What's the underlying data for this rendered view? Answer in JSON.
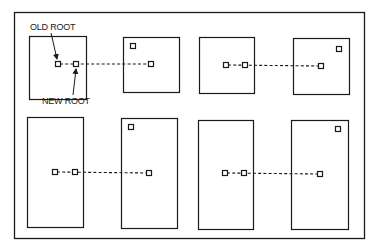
{
  "diagram": {
    "labels": {
      "old_root": "OLD ROOT",
      "new_root": "NEW ROOT"
    },
    "colors": {
      "ink": "#1a1a1a",
      "background": "#ffffff"
    },
    "frame": {
      "x": 14,
      "y": 12,
      "w": 351,
      "h": 227
    },
    "panels": [
      {
        "id": "top-1",
        "x": 29,
        "y": 36,
        "w": 58,
        "h": 63,
        "nodes": [
          [
            58,
            63
          ],
          [
            76,
            64
          ]
        ],
        "line_to": [
          151,
          64
        ]
      },
      {
        "id": "top-2",
        "x": 123,
        "y": 37,
        "w": 57,
        "h": 55,
        "nodes": [
          [
            133,
            46
          ],
          [
            151,
            64
          ]
        ]
      },
      {
        "id": "top-3",
        "x": 199,
        "y": 37,
        "w": 56,
        "h": 56,
        "nodes": [
          [
            226,
            65
          ],
          [
            245,
            65
          ]
        ],
        "line_to": [
          321,
          66
        ]
      },
      {
        "id": "top-4",
        "x": 293,
        "y": 38,
        "w": 57,
        "h": 56,
        "nodes": [
          [
            339,
            49
          ],
          [
            321,
            66
          ]
        ]
      },
      {
        "id": "bottom-1",
        "x": 27,
        "y": 117,
        "w": 57,
        "h": 110,
        "nodes": [
          [
            55,
            172
          ],
          [
            75,
            172
          ]
        ],
        "line_to": [
          149,
          173
        ]
      },
      {
        "id": "bottom-2",
        "x": 121,
        "y": 118,
        "w": 57,
        "h": 110,
        "nodes": [
          [
            131,
            127
          ],
          [
            149,
            173
          ]
        ]
      },
      {
        "id": "bottom-3",
        "x": 198,
        "y": 120,
        "w": 56,
        "h": 109,
        "nodes": [
          [
            225,
            173
          ],
          [
            244,
            173
          ]
        ],
        "line_to": [
          320,
          174
        ]
      },
      {
        "id": "bottom-4",
        "x": 291,
        "y": 120,
        "w": 58,
        "h": 109,
        "nodes": [
          [
            338,
            129
          ],
          [
            320,
            174
          ]
        ]
      }
    ]
  }
}
